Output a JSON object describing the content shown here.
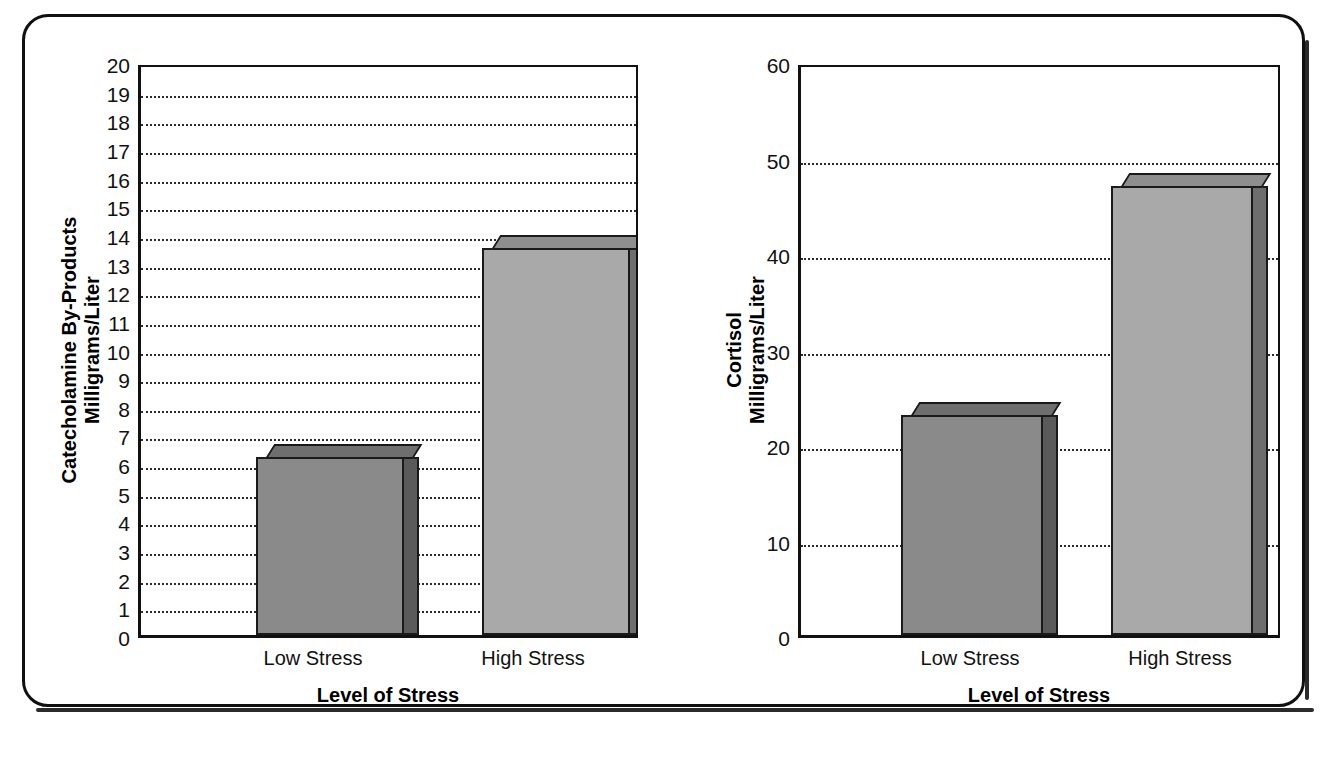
{
  "figure": {
    "frame": "rounded-rectangle-border",
    "background": "#ffffff",
    "ink_color": "#111111"
  },
  "chart_data": [
    {
      "id": "catecholamine",
      "type": "bar",
      "title": "",
      "categories": [
        "Low Stress",
        "High Stress"
      ],
      "values": [
        6.2,
        13.5
      ],
      "xlabel": "Level of Stress",
      "ylabel": "Catecholamine By-Products\nMilligrams/Liter",
      "ylim": [
        0,
        20
      ],
      "ytick_step": 1,
      "yticks": [
        20,
        19,
        18,
        17,
        16,
        15,
        14,
        13,
        12,
        11,
        10,
        9,
        8,
        7,
        6,
        5,
        4,
        3,
        2,
        1,
        0
      ],
      "grid": "horizontal-dotted",
      "legend": "none",
      "bar_colors": [
        "#8a8a8a",
        "#a9a9a9"
      ],
      "bar_top_colors": [
        "#6f6f6f",
        "#8e8e8e"
      ],
      "bar_side_colors": [
        "#5a5a5a",
        "#6e6e6e"
      ]
    },
    {
      "id": "cortisol",
      "type": "bar",
      "title": "",
      "categories": [
        "Low Stress",
        "High Stress"
      ],
      "values": [
        23,
        47
      ],
      "xlabel": "Level of Stress",
      "ylabel": "Cortisol\nMilligrams/Liter",
      "ylim": [
        0,
        60
      ],
      "ytick_step": 10,
      "yticks": [
        60,
        50,
        40,
        30,
        20,
        10,
        0
      ],
      "grid": "horizontal-dotted",
      "legend": "none",
      "bar_colors": [
        "#8a8a8a",
        "#a9a9a9"
      ],
      "bar_top_colors": [
        "#6f6f6f",
        "#8e8e8e"
      ],
      "bar_side_colors": [
        "#5a5a5a",
        "#6e6e6e"
      ]
    }
  ],
  "charts": {
    "left": {
      "ylabel_line1": "Catecholamine By-Products",
      "ylabel_line2": "Milligrams/Liter",
      "xlabel": "Level of Stress",
      "cat1": "Low Stress",
      "cat2": "High Stress",
      "tick_20": "20",
      "tick_19": "19",
      "tick_18": "18",
      "tick_17": "17",
      "tick_16": "16",
      "tick_15": "15",
      "tick_14": "14",
      "tick_13": "13",
      "tick_12": "12",
      "tick_11": "11",
      "tick_10": "10",
      "tick_9": "9",
      "tick_8": "8",
      "tick_7": "7",
      "tick_6": "6",
      "tick_5": "5",
      "tick_4": "4",
      "tick_3": "3",
      "tick_2": "2",
      "tick_1": "1",
      "tick_0": "0"
    },
    "right": {
      "ylabel_line1": "Cortisol",
      "ylabel_line2": "Milligrams/Liter",
      "xlabel": "Level of Stress",
      "cat1": "Low Stress",
      "cat2": "High Stress",
      "tick_60": "60",
      "tick_50": "50",
      "tick_40": "40",
      "tick_30": "30",
      "tick_20": "20",
      "tick_10": "10",
      "tick_0": "0"
    }
  }
}
